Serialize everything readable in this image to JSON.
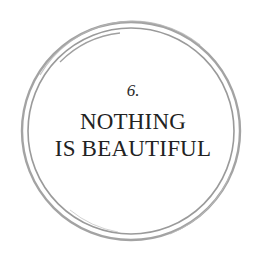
{
  "badge": {
    "number": "6.",
    "title_lines": [
      "NOTHING",
      "IS BEAUTIFUL"
    ]
  },
  "colors": {
    "background": "#ffffff",
    "ring": "#9a9a9a",
    "text": "#222222"
  }
}
